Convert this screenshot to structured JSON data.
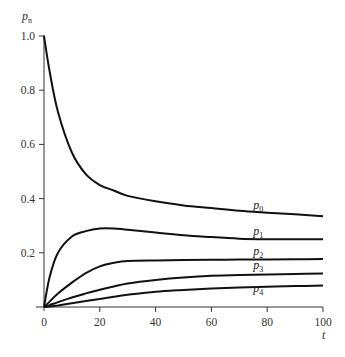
{
  "chart_data": {
    "type": "line",
    "title": "",
    "xlabel": "t",
    "ylabel": "p_n",
    "xlim": [
      0,
      100
    ],
    "ylim": [
      0,
      1.0
    ],
    "grid": false,
    "legend": "inline labels at right end of curves",
    "xticks": [
      "0",
      "20",
      "40",
      "60",
      "80",
      "100"
    ],
    "yticks": [
      "0.2",
      "0.4",
      "0.6",
      "0.8",
      "1.0"
    ],
    "x": [
      0,
      2,
      5,
      10,
      15,
      20,
      25,
      30,
      40,
      50,
      60,
      70,
      80,
      90,
      100
    ],
    "series": [
      {
        "name": "p0",
        "label_main": "p",
        "label_sub": "0",
        "values": [
          1.0,
          0.87,
          0.72,
          0.57,
          0.49,
          0.45,
          0.43,
          0.41,
          0.39,
          0.375,
          0.365,
          0.355,
          0.348,
          0.342,
          0.335
        ]
      },
      {
        "name": "p1",
        "label_main": "p",
        "label_sub": "1",
        "values": [
          0.0,
          0.11,
          0.2,
          0.26,
          0.28,
          0.29,
          0.29,
          0.285,
          0.275,
          0.265,
          0.258,
          0.252,
          0.25,
          0.25,
          0.25
        ]
      },
      {
        "name": "p2",
        "label_main": "p",
        "label_sub": "2",
        "values": [
          0.0,
          0.02,
          0.05,
          0.09,
          0.125,
          0.15,
          0.163,
          0.17,
          0.172,
          0.173,
          0.174,
          0.175,
          0.175,
          0.176,
          0.177
        ]
      },
      {
        "name": "p3",
        "label_main": "p",
        "label_sub": "3",
        "values": [
          0.0,
          0.007,
          0.018,
          0.035,
          0.05,
          0.064,
          0.076,
          0.087,
          0.1,
          0.109,
          0.115,
          0.118,
          0.12,
          0.122,
          0.124
        ]
      },
      {
        "name": "p4",
        "label_main": "p",
        "label_sub": "4",
        "values": [
          0.0,
          0.002,
          0.006,
          0.014,
          0.022,
          0.03,
          0.038,
          0.045,
          0.056,
          0.063,
          0.068,
          0.072,
          0.075,
          0.077,
          0.079
        ]
      }
    ],
    "label_positions": {
      "p0": {
        "t": 80,
        "v": 0.36
      },
      "p1": {
        "t": 80,
        "v": 0.265
      },
      "p2": {
        "t": 80,
        "v": 0.192
      },
      "p3": {
        "t": 80,
        "v": 0.142
      },
      "p4": {
        "t": 80,
        "v": 0.055
      }
    }
  }
}
